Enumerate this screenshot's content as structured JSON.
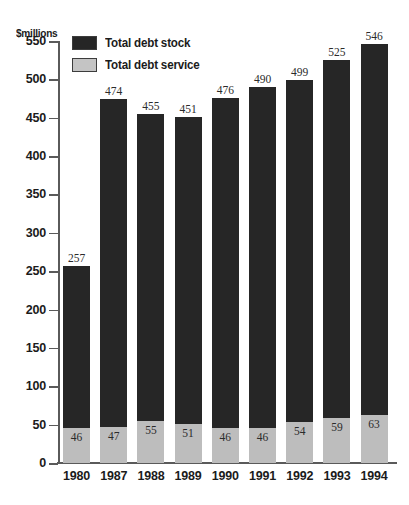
{
  "chart_data": {
    "type": "bar",
    "title": "",
    "subtitle": "",
    "xlabel": "",
    "ylabel": "$millions",
    "ylim": [
      0,
      550
    ],
    "ytick_step": 50,
    "yticks": [
      0,
      50,
      100,
      150,
      200,
      250,
      300,
      350,
      400,
      450,
      500,
      550
    ],
    "grid": false,
    "legend_position": "top-left",
    "stacked": true,
    "categories": [
      "1980",
      "1987",
      "1988",
      "1989",
      "1990",
      "1991",
      "1992",
      "1993",
      "1994"
    ],
    "series": [
      {
        "name": "Total debt stock",
        "color": "#262626",
        "values": [
          257,
          474,
          455,
          451,
          476,
          490,
          499,
          525,
          546
        ]
      },
      {
        "name": "Total debt service",
        "color": "#bdbdbd",
        "values": [
          46,
          47,
          55,
          51,
          46,
          46,
          54,
          59,
          63
        ]
      }
    ]
  },
  "axis": {
    "y_title": "$millions",
    "y_tick_labels": [
      "550",
      "500",
      "450",
      "400",
      "350",
      "300",
      "250",
      "200",
      "150",
      "100",
      "50",
      "0"
    ],
    "x_tick_labels": [
      "1980",
      "1987",
      "1988",
      "1989",
      "1990",
      "1991",
      "1992",
      "1993",
      "1994"
    ]
  },
  "legend": {
    "items": [
      {
        "label": "Total debt stock",
        "color": "#262626"
      },
      {
        "label": "Total debt service",
        "color": "#c4c4c4"
      }
    ]
  },
  "labels": {
    "stock_values": [
      "257",
      "474",
      "455",
      "451",
      "476",
      "490",
      "499",
      "525",
      "546"
    ],
    "service_values": [
      "46",
      "47",
      "55",
      "51",
      "46",
      "46",
      "54",
      "59",
      "63"
    ]
  },
  "colors": {
    "background": "#ffffff",
    "axis": "#5a5a5a",
    "text": "#1b1b1b",
    "value_text": "#2b2b2b",
    "stock": "#262626",
    "service": "#bdbdbd"
  }
}
